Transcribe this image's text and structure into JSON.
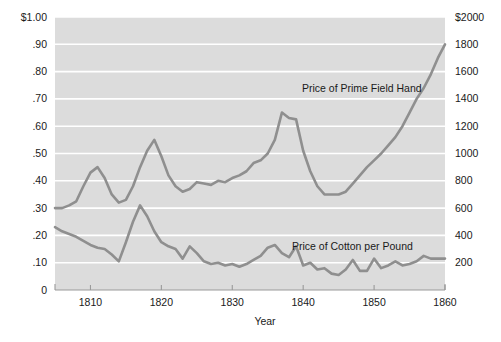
{
  "chart_data": {
    "type": "line",
    "title": "",
    "xlabel": "Year",
    "ylabel": "",
    "xlim": [
      1805,
      1860
    ],
    "grid": true,
    "legend_position": "inline-annotation",
    "x_ticks": [
      "1810",
      "1820",
      "1830",
      "1840",
      "1850",
      "1860"
    ],
    "x_tick_values": [
      1810,
      1820,
      1830,
      1840,
      1850,
      1860
    ],
    "left_axis": {
      "label": "",
      "ylim": [
        0,
        1.0
      ],
      "ticks": [
        "0",
        ".10",
        ".20",
        ".30",
        ".40",
        ".50",
        ".60",
        ".70",
        ".80",
        ".90",
        "$1.00"
      ],
      "tick_values": [
        0,
        0.1,
        0.2,
        0.3,
        0.4,
        0.5,
        0.6,
        0.7,
        0.8,
        0.9,
        1.0
      ]
    },
    "right_axis": {
      "label": "",
      "ylim": [
        0,
        2000
      ],
      "ticks": [
        "200",
        "400",
        "600",
        "800",
        "1000",
        "1200",
        "1400",
        "1600",
        "1800",
        "$2000"
      ],
      "tick_values": [
        200,
        400,
        600,
        800,
        1000,
        1200,
        1400,
        1600,
        1800,
        2000
      ]
    },
    "series": [
      {
        "name": "Price of Prime Field Hand",
        "axis": "right",
        "units": "dollars",
        "annotation": "Price of Prime Field Hand",
        "x": [
          1805,
          1806,
          1807,
          1808,
          1809,
          1810,
          1811,
          1812,
          1813,
          1814,
          1815,
          1816,
          1817,
          1818,
          1819,
          1820,
          1821,
          1822,
          1823,
          1824,
          1825,
          1826,
          1827,
          1828,
          1829,
          1830,
          1831,
          1832,
          1833,
          1834,
          1835,
          1836,
          1837,
          1838,
          1839,
          1840,
          1841,
          1842,
          1843,
          1844,
          1845,
          1846,
          1847,
          1848,
          1849,
          1850,
          1851,
          1852,
          1853,
          1854,
          1855,
          1856,
          1857,
          1858,
          1859,
          1860
        ],
        "values": [
          600,
          600,
          620,
          650,
          760,
          860,
          900,
          820,
          700,
          640,
          660,
          760,
          900,
          1020,
          1100,
          980,
          840,
          760,
          720,
          740,
          790,
          780,
          770,
          800,
          790,
          820,
          840,
          870,
          930,
          950,
          1000,
          1100,
          1300,
          1260,
          1250,
          1020,
          870,
          760,
          700,
          700,
          700,
          720,
          780,
          840,
          900,
          950,
          1000,
          1060,
          1120,
          1200,
          1300,
          1400,
          1480,
          1580,
          1700,
          1800
        ]
      },
      {
        "name": "Price of Cotton per Pound",
        "axis": "left",
        "units": "dollars per pound",
        "annotation": "Price of Cotton per Pound",
        "x": [
          1805,
          1806,
          1807,
          1808,
          1809,
          1810,
          1811,
          1812,
          1813,
          1814,
          1815,
          1816,
          1817,
          1818,
          1819,
          1820,
          1821,
          1822,
          1823,
          1824,
          1825,
          1826,
          1827,
          1828,
          1829,
          1830,
          1831,
          1832,
          1833,
          1834,
          1835,
          1836,
          1837,
          1838,
          1839,
          1840,
          1841,
          1842,
          1843,
          1844,
          1845,
          1846,
          1847,
          1848,
          1849,
          1850,
          1851,
          1852,
          1853,
          1854,
          1855,
          1856,
          1857,
          1858,
          1859,
          1860
        ],
        "values": [
          0.23,
          0.215,
          0.205,
          0.195,
          0.18,
          0.165,
          0.155,
          0.15,
          0.13,
          0.105,
          0.175,
          0.25,
          0.31,
          0.27,
          0.215,
          0.175,
          0.16,
          0.15,
          0.115,
          0.16,
          0.135,
          0.105,
          0.095,
          0.1,
          0.09,
          0.095,
          0.085,
          0.095,
          0.11,
          0.125,
          0.155,
          0.165,
          0.135,
          0.12,
          0.16,
          0.09,
          0.1,
          0.075,
          0.08,
          0.06,
          0.055,
          0.075,
          0.11,
          0.07,
          0.07,
          0.115,
          0.08,
          0.09,
          0.105,
          0.09,
          0.095,
          0.105,
          0.125,
          0.115,
          0.115,
          0.115
        ]
      }
    ]
  },
  "colors": {
    "plot_background": "#dcdcdc",
    "gridline": "#ffffff",
    "line": "#8f8f8f",
    "text": "#1a1a1a",
    "axis": "#9a9a9a"
  },
  "annotations": {
    "field_hand": "Price of Prime Field Hand",
    "cotton": "Price of Cotton per Pound"
  }
}
